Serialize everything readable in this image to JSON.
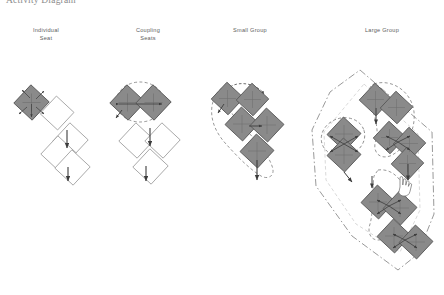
{
  "figure": {
    "title": "Activity Diagram",
    "background_color": "#ffffff"
  },
  "palette": {
    "occupied_fill": "#8a8a8a",
    "occupied_stroke": "#5a5a5a",
    "empty_fill": "#ffffff",
    "empty_stroke": "#9a9a9a",
    "arrow_color": "#3c3c3c",
    "enclosure_color": "#8d8d8d",
    "label_color": "#5d5d5d",
    "title_color": "#8c8c8c"
  },
  "columns": [
    {
      "id": "individual-seat",
      "label": "Individual\nSeat",
      "occupied_units": 1,
      "empty_units": 3,
      "enclosure": "none",
      "arrows": [
        "radial-four-corner",
        "down"
      ]
    },
    {
      "id": "coupling-seats",
      "label": "Coupling\nSeats",
      "occupied_units": 2,
      "empty_units": 3,
      "enclosure": "dashed-ellipse",
      "arrows": [
        "bidirectional-horizontal",
        "down"
      ]
    },
    {
      "id": "small-group",
      "label": "Small Group",
      "occupied_units": 5,
      "empty_units": 0,
      "enclosure": "dashed-loop",
      "arrows": [
        "curved-loop",
        "cross",
        "down"
      ]
    },
    {
      "id": "large-group",
      "label": "Large Group",
      "occupied_units": 11,
      "empty_units": 0,
      "enclosure": "dash-dot-polygon",
      "arrows": [
        "curved-loop",
        "cross",
        "down",
        "pointer"
      ]
    }
  ],
  "icons": {
    "pointer": "hand-cursor-icon"
  }
}
